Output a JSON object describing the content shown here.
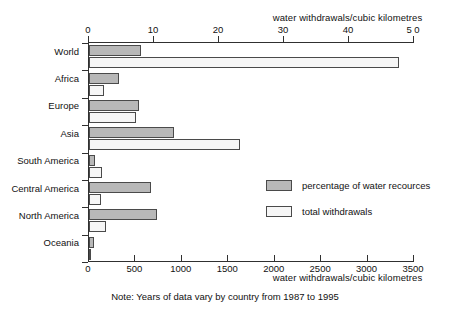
{
  "chart_data": {
    "type": "bar",
    "orientation": "horizontal",
    "title": "",
    "categories": [
      "World",
      "Africa",
      "Europe",
      "Asia",
      "South America",
      "Central America",
      "North America",
      "Oceania"
    ],
    "series": [
      {
        "name": "percentage of water recources",
        "axis": "top",
        "values": [
          8.0,
          4.6,
          7.7,
          13.1,
          0.9,
          9.5,
          10.5,
          0.8
        ],
        "color": "#b8b8b8"
      },
      {
        "name": "total withdrawals",
        "axis": "bottom",
        "values": [
          3340,
          160,
          505,
          1625,
          140,
          130,
          185,
          25
        ],
        "color": "#f6f6f6"
      }
    ],
    "top_axis": {
      "label": "water withdrawals/cubic kilometres",
      "ticks": [
        0,
        10,
        20,
        30,
        40,
        50
      ],
      "tick_labels": [
        "0",
        "10",
        "20",
        "30",
        "40",
        "5 0"
      ],
      "range": [
        0,
        50
      ]
    },
    "bottom_axis": {
      "label": "water withdrawals/cubic kilometres",
      "ticks": [
        0,
        500,
        1000,
        1500,
        2000,
        2500,
        3000,
        3500
      ],
      "tick_labels": [
        "0",
        "500",
        "1000",
        "1500",
        "2000",
        "2500",
        "3000",
        "3500"
      ],
      "range": [
        0,
        3500
      ]
    },
    "ylabel": "",
    "grid": false,
    "legend_position": "inside-right",
    "legend": [
      {
        "label": "percentage of water recources",
        "color": "#b8b8b8"
      },
      {
        "label": "total withdrawals",
        "color": "#f6f6f6"
      }
    ],
    "note": "Note: Years of data vary by country from 1987 to 1995"
  }
}
